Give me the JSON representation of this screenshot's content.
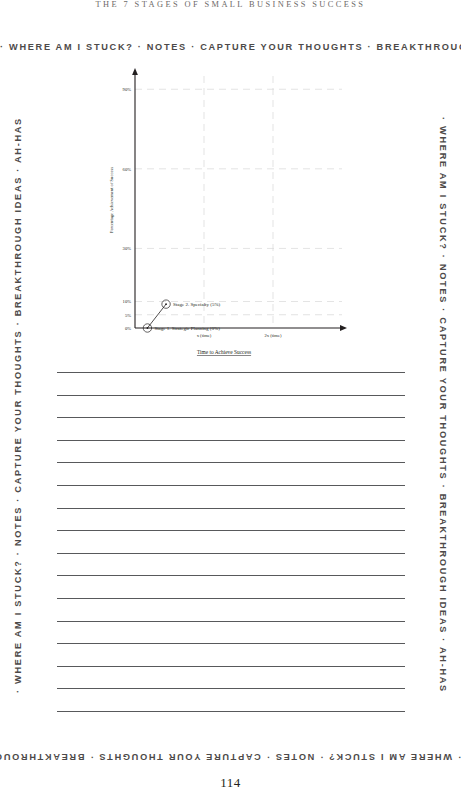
{
  "page": {
    "running_head": "THE 7 STAGES OF SMALL BUSINESS SUCCESS",
    "folio": "114",
    "margin_banner": "· WHERE AM I STUCK? · NOTES · CAPTURE YOUR THOUGHTS · BREAKTHROUGH IDEAS · AH-HAS",
    "ruled_line_count": 16
  },
  "chart_data": {
    "type": "line",
    "title": "",
    "xlabel": "Time to Achieve Success",
    "ylabel": "Percentage Achievement of Success",
    "x_tick_labels": [
      "x (time)",
      "2x (time)"
    ],
    "y_tick_labels": [
      "90%",
      "60%",
      "30%",
      "10%",
      "5%",
      "0%"
    ],
    "y_tick_values": [
      90,
      60,
      30,
      10,
      5,
      0
    ],
    "ylim": [
      0,
      95
    ],
    "xlim": [
      0,
      3
    ],
    "grid": true,
    "legend_position": "none",
    "points": [
      {
        "label": "Stage 1. Strategic Planning (0%)",
        "stage": 1,
        "name": "Strategic Planning",
        "value_pct": 0,
        "x": 0.18,
        "y": 0
      },
      {
        "label": "Stage 2. Specialty (5%)",
        "stage": 2,
        "name": "Specialty",
        "value_pct": 5,
        "x": 0.45,
        "y": 9
      }
    ],
    "series": [
      {
        "name": "Stages of Success",
        "x": [
          0.18,
          0.45
        ],
        "values": [
          0,
          9
        ]
      }
    ]
  },
  "colors": {
    "ink": "#231f20",
    "rule": "#58595b",
    "grid": "#d9d9d9",
    "running_head": "#6e6a68",
    "margin": "#4d4a49"
  }
}
